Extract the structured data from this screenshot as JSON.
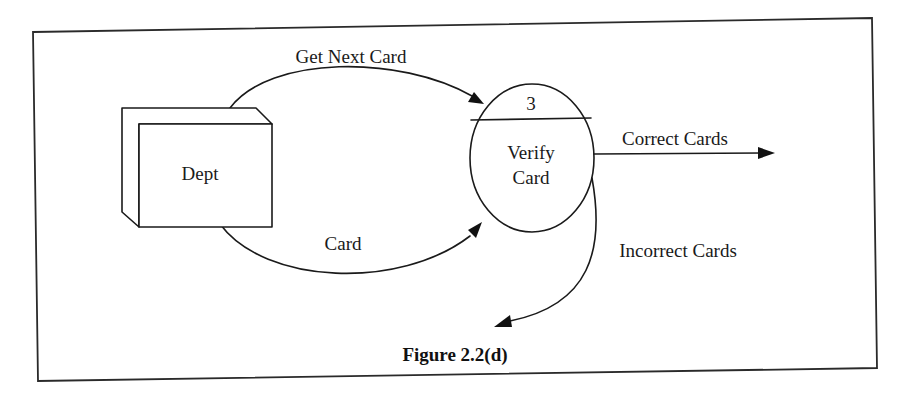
{
  "figure": {
    "caption": "Figure 2.2(d)",
    "type": "data-flow-diagram"
  },
  "external_entity": {
    "label": "Dept"
  },
  "process": {
    "number": "3",
    "label_line1": "Verify",
    "label_line2": "Card"
  },
  "flows": [
    {
      "label": "Get Next Card",
      "from": "Dept",
      "to": "Verify Card"
    },
    {
      "label": "Card",
      "from": "Dept",
      "to": "Verify Card"
    },
    {
      "label": "Correct Cards",
      "from": "Verify Card",
      "to": ""
    },
    {
      "label": "Incorrect Cards",
      "from": "Verify Card",
      "to": ""
    }
  ],
  "colors": {
    "ink": "#1a1a1a",
    "paper": "#ffffff"
  }
}
